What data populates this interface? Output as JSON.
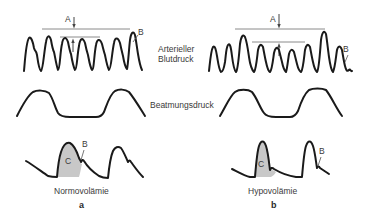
{
  "labels": {
    "arterial_pressure_line1": "Arterieller",
    "arterial_pressure_line2": "Blutdruck",
    "ventilation_pressure": "Beatmungsdruck"
  },
  "panels": [
    {
      "id": "a",
      "letter": "a",
      "condition": "Normovolämie",
      "markers": {
        "A": "A",
        "B_top": "B",
        "B_detail": "B",
        "C": "C"
      }
    },
    {
      "id": "b",
      "letter": "b",
      "condition": "Hypovolämie",
      "markers": {
        "A": "A",
        "B_top": "B",
        "B_detail": "B",
        "C": "C"
      }
    }
  ],
  "colors": {
    "stroke": "#1a1a1a",
    "reference_line": "#8a8a8a",
    "shade": "#c8c8c8",
    "text": "#3a3a3a"
  }
}
